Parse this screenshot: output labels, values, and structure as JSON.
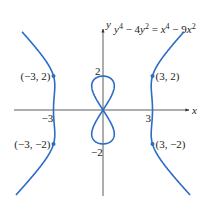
{
  "chart_data": {
    "type": "line",
    "equation": {
      "lhs": "y⁴ − 4y²",
      "rhs": "x⁴ − 9x²",
      "display": "y⁴ − 4y² = x⁴ − 9x²"
    },
    "xlabel": "x",
    "ylabel": "y",
    "x_ticks": [
      {
        "value": -3,
        "label": "−3"
      },
      {
        "value": 3,
        "label": "3"
      }
    ],
    "y_ticks": [
      {
        "value": 2,
        "label": "2"
      },
      {
        "value": -2,
        "label": "−2"
      }
    ],
    "points": [
      {
        "x": -3,
        "y": 2,
        "label": "(−3, 2)"
      },
      {
        "x": 3,
        "y": 2,
        "label": "(3, 2)"
      },
      {
        "x": -3,
        "y": -2,
        "label": "(−3, −2)"
      },
      {
        "x": 3,
        "y": -2,
        "label": "(3, −2)"
      }
    ],
    "xlim": [
      -5.4,
      5.2
    ],
    "ylim": [
      -5.0,
      4.6
    ],
    "grid": false,
    "legend": "none",
    "curve_color": "#2b6cc4",
    "axis_color": "#333333",
    "components": [
      "inner figure-eight loop through origin (y from −2 to 2)",
      "left outer branch near x = −3",
      "right outer branch near x = 3"
    ]
  },
  "layout": {
    "origin_px": [
      103,
      110
    ],
    "x_scale_px": 16.5,
    "y_scale_px": 17
  }
}
